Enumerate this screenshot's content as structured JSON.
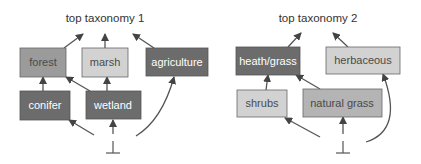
{
  "diagrams": [
    {
      "title": "top taxonomy 1",
      "bottom_symbol": "⊥",
      "nodes": [
        {
          "id": "forest",
          "label": "forest",
          "shade": "medium",
          "fill": "#9b9b9b",
          "text_color": "#4a4a4a"
        },
        {
          "id": "marsh",
          "label": "marsh",
          "shade": "light",
          "fill": "#d2d2d2",
          "text_color": "#4a4a4a"
        },
        {
          "id": "agriculture",
          "label": "agriculture",
          "shade": "dark",
          "fill": "#6c6c6c",
          "text_color": "#ffffff"
        },
        {
          "id": "conifer",
          "label": "conifer",
          "shade": "dark",
          "fill": "#6c6c6c",
          "text_color": "#ffffff"
        },
        {
          "id": "wetland",
          "label": "wetland",
          "shade": "dark",
          "fill": "#6c6c6c",
          "text_color": "#ffffff"
        }
      ],
      "edges": [
        {
          "from": "forest",
          "to": "top"
        },
        {
          "from": "marsh",
          "to": "top"
        },
        {
          "from": "agriculture",
          "to": "top"
        },
        {
          "from": "conifer",
          "to": "forest"
        },
        {
          "from": "wetland",
          "to": "forest"
        },
        {
          "from": "wetland",
          "to": "marsh"
        },
        {
          "from": "bottom",
          "to": "conifer"
        },
        {
          "from": "bottom",
          "to": "wetland"
        },
        {
          "from": "bottom",
          "to": "agriculture"
        }
      ]
    },
    {
      "title": "top taxonomy 2",
      "bottom_symbol": "⊥",
      "nodes": [
        {
          "id": "heath_grass",
          "label": "heath/grass",
          "shade": "dark",
          "fill": "#6c6c6c",
          "text_color": "#ffffff"
        },
        {
          "id": "herbaceous",
          "label": "herbaceous",
          "shade": "light",
          "fill": "#d2d2d2",
          "text_color": "#4a4a4a"
        },
        {
          "id": "shrubs",
          "label": "shrubs",
          "shade": "light",
          "fill": "#d2d2d2",
          "text_color": "#4a4a4a"
        },
        {
          "id": "natural_grass",
          "label": "natural grass",
          "shade": "medium-light",
          "fill": "#b4b4b4",
          "text_color": "#4a4a4a"
        }
      ],
      "edges": [
        {
          "from": "heath_grass",
          "to": "top"
        },
        {
          "from": "herbaceous",
          "to": "top"
        },
        {
          "from": "shrubs",
          "to": "heath_grass"
        },
        {
          "from": "natural_grass",
          "to": "heath_grass"
        },
        {
          "from": "bottom",
          "to": "shrubs"
        },
        {
          "from": "bottom",
          "to": "natural_grass"
        },
        {
          "from": "bottom",
          "to": "herbaceous"
        }
      ]
    }
  ]
}
